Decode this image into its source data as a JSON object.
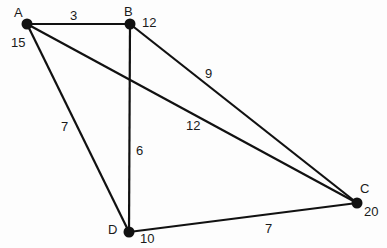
{
  "graph": {
    "nodes": [
      {
        "id": "A",
        "label": "A",
        "weight": "15"
      },
      {
        "id": "B",
        "label": "B",
        "weight": "12"
      },
      {
        "id": "C",
        "label": "C",
        "weight": "20"
      },
      {
        "id": "D",
        "label": "D",
        "weight": "10"
      }
    ],
    "edges": [
      {
        "from": "A",
        "to": "B",
        "weight": "3"
      },
      {
        "from": "B",
        "to": "C",
        "weight": "9"
      },
      {
        "from": "A",
        "to": "C",
        "weight": "12"
      },
      {
        "from": "A",
        "to": "D",
        "weight": "7"
      },
      {
        "from": "B",
        "to": "D",
        "weight": "6"
      },
      {
        "from": "D",
        "to": "C",
        "weight": "7"
      }
    ]
  }
}
